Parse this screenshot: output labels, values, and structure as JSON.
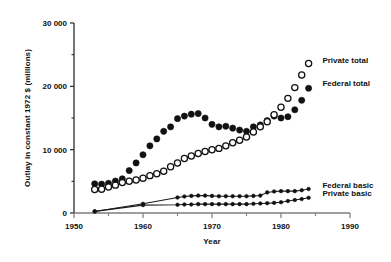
{
  "chart_data": {
    "type": "scatter",
    "title": "",
    "xlabel": "Year",
    "ylabel": "Outlay in constant 1972 $ (millions)",
    "xlim": [
      1950,
      1990
    ],
    "ylim": [
      0,
      30000
    ],
    "xticks": [
      1950,
      1960,
      1970,
      1980,
      1990
    ],
    "xticklabels": [
      "1950",
      "1960",
      "1970",
      "1980",
      "1990"
    ],
    "xminorticks": [
      1955,
      1965,
      1975,
      1985
    ],
    "yticks": [
      0,
      10000,
      20000,
      30000
    ],
    "yticklabels": [
      "0",
      "10 000",
      "20 000",
      "30 000"
    ],
    "yminorticks": [
      5000,
      15000,
      25000
    ],
    "grid": false,
    "legend_position": "inline-right",
    "series": [
      {
        "name": "Federal total",
        "marker": "filled-circle",
        "line": false,
        "label": "Federal total",
        "label_x": 1986.0,
        "label_y": 20600,
        "x": [
          1953,
          1954,
          1955,
          1956,
          1957,
          1958,
          1959,
          1960,
          1961,
          1962,
          1963,
          1964,
          1965,
          1966,
          1967,
          1968,
          1969,
          1970,
          1971,
          1972,
          1973,
          1974,
          1975,
          1976,
          1977,
          1978,
          1979,
          1980,
          1981,
          1982,
          1983,
          1984
        ],
        "y": [
          4600,
          4550,
          4700,
          5050,
          5400,
          6700,
          7900,
          9200,
          10600,
          11700,
          12900,
          13600,
          14900,
          15300,
          15600,
          15700,
          15000,
          14000,
          13600,
          13700,
          13400,
          13100,
          12900,
          13600,
          13900,
          14600,
          15300,
          15000,
          15200,
          16300,
          17800,
          19700
        ]
      },
      {
        "name": "Private total",
        "marker": "open-circle",
        "line": false,
        "label": "Private total",
        "label_x": 1986.0,
        "label_y": 24200,
        "x": [
          1953,
          1954,
          1955,
          1956,
          1957,
          1958,
          1959,
          1960,
          1961,
          1962,
          1963,
          1964,
          1965,
          1966,
          1967,
          1968,
          1969,
          1970,
          1971,
          1972,
          1973,
          1974,
          1975,
          1976,
          1977,
          1978,
          1979,
          1980,
          1981,
          1982,
          1983,
          1984
        ],
        "y": [
          3700,
          3750,
          4100,
          4400,
          4800,
          5000,
          5200,
          5500,
          5900,
          6200,
          6600,
          7300,
          7900,
          8600,
          9000,
          9400,
          9700,
          10000,
          10200,
          10600,
          11100,
          11500,
          12000,
          12800,
          13600,
          14400,
          15500,
          16700,
          18100,
          19800,
          21800,
          23600
        ]
      },
      {
        "name": "Federal basic",
        "marker": "small-filled-circle",
        "line": true,
        "label": "Federal basic",
        "label_x": 1986.0,
        "label_y": 4400,
        "x": [
          1953,
          1960,
          1965,
          1966,
          1967,
          1968,
          1969,
          1970,
          1971,
          1972,
          1973,
          1974,
          1975,
          1976,
          1977,
          1978,
          1979,
          1980,
          1981,
          1982,
          1983,
          1984
        ],
        "y": [
          250,
          1450,
          2450,
          2600,
          2700,
          2750,
          2750,
          2700,
          2650,
          2650,
          2650,
          2650,
          2650,
          2700,
          2750,
          3250,
          3400,
          3450,
          3450,
          3450,
          3600,
          3800
        ]
      },
      {
        "name": "Private basic",
        "marker": "small-filled-circle",
        "line": true,
        "label": "Private basic",
        "label_x": 1986.0,
        "label_y": 3100,
        "x": [
          1953,
          1960,
          1965,
          1966,
          1967,
          1968,
          1969,
          1970,
          1971,
          1972,
          1973,
          1974,
          1975,
          1976,
          1977,
          1978,
          1979,
          1980,
          1981,
          1982,
          1983,
          1984
        ],
        "y": [
          250,
          1250,
          1300,
          1350,
          1350,
          1400,
          1400,
          1400,
          1400,
          1400,
          1400,
          1400,
          1400,
          1450,
          1500,
          1550,
          1600,
          1700,
          1900,
          2050,
          2200,
          2400
        ]
      }
    ]
  }
}
